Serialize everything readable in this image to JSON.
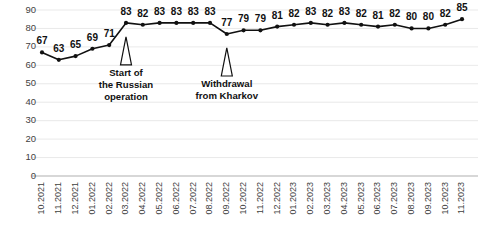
{
  "chart_data": {
    "type": "line",
    "title": "",
    "subtitle": "",
    "xlabel": "",
    "ylabel": "",
    "ylim": [
      0,
      90
    ],
    "ytick_step": 10,
    "grid": true,
    "legend": "none",
    "show_value_labels": true,
    "marker": "filled-circle",
    "line_color": "#111111",
    "marker_color": "#111111",
    "grid_color": "#e3e3e3",
    "categories": [
      "10.2021",
      "11.2021",
      "12.2021",
      "01.2022",
      "02.2022",
      "03.2022",
      "04.2022",
      "05.2022",
      "06.2022",
      "07.2022",
      "08.2022",
      "09.2022",
      "10.2022",
      "11.2022",
      "12.2022",
      "01.2023",
      "02.2023",
      "03.2023",
      "04.2023",
      "05.2023",
      "06.2023",
      "07.2023",
      "08.2023",
      "09.2023",
      "10.2023",
      "11.2023"
    ],
    "values": [
      67,
      63,
      65,
      69,
      71,
      83,
      82,
      83,
      83,
      83,
      83,
      77,
      79,
      79,
      81,
      82,
      83,
      82,
      83,
      82,
      81,
      82,
      80,
      80,
      82,
      85
    ],
    "yticks": [
      "0",
      "10",
      "20",
      "30",
      "40",
      "50",
      "60",
      "70",
      "80",
      "90"
    ],
    "annotations": [
      {
        "id": "start-russian-operation",
        "lines": [
          "Start of",
          "the Russian",
          "operation"
        ],
        "category": "03.2022",
        "marker": "up-arrow"
      },
      {
        "id": "withdrawal-from-kharkov",
        "lines": [
          "Withdrawal",
          "from Kharkov"
        ],
        "category": "09.2022",
        "marker": "up-arrow"
      }
    ]
  }
}
